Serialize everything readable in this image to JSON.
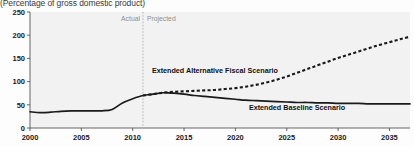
{
  "subtitle": "(Percentage of gross domestic product)",
  "annotations": {
    "actual": "Actual",
    "projected": "Projected",
    "divider_year": 2011
  },
  "colors": {
    "line": "#1a1a1a",
    "divider": "#b0b0b0",
    "axis": "#555555",
    "plot_background": "#f2f2f2",
    "annotation_text": "#8e8e8e"
  },
  "chart_data": {
    "type": "line",
    "title": "",
    "subtitle": "(Percentage of gross domestic product)",
    "xlabel": "",
    "ylabel": "",
    "xlim": [
      2000,
      2037
    ],
    "ylim": [
      0,
      250
    ],
    "yticks": [
      0,
      50,
      100,
      150,
      200,
      250
    ],
    "xticks": [
      2000,
      2005,
      2010,
      2015,
      2020,
      2025,
      2030,
      2035
    ],
    "grid": false,
    "legend_position": "inline-annotations",
    "series": [
      {
        "name": "Extended Alternative Fiscal Scenario",
        "style": "dashed",
        "label_x": 2018,
        "label_y": 118,
        "x": [
          2011,
          2012,
          2013,
          2014,
          2015,
          2016,
          2017,
          2018,
          2019,
          2020,
          2021,
          2022,
          2023,
          2024,
          2025,
          2026,
          2027,
          2028,
          2029,
          2030,
          2031,
          2032,
          2033,
          2034,
          2035,
          2036,
          2037
        ],
        "values": [
          70,
          73,
          76,
          78,
          79,
          80,
          81,
          82,
          84,
          86,
          89,
          93,
          98,
          104,
          111,
          119,
          127,
          135,
          143,
          151,
          158,
          165,
          172,
          179,
          185,
          191,
          197
        ]
      },
      {
        "name": "Extended Baseline Scenario",
        "style": "solid",
        "label_x": 2026,
        "label_y": 38,
        "x": [
          2000,
          2001,
          2002,
          2003,
          2004,
          2005,
          2006,
          2007,
          2008,
          2009,
          2010,
          2011,
          2012,
          2013,
          2014,
          2015,
          2016,
          2017,
          2018,
          2019,
          2020,
          2021,
          2022,
          2023,
          2024,
          2025,
          2026,
          2027,
          2028,
          2029,
          2030,
          2031,
          2032,
          2033,
          2034,
          2035,
          2036,
          2037
        ],
        "values": [
          35,
          33,
          34,
          36,
          37,
          37,
          37,
          37,
          40,
          54,
          63,
          70,
          73,
          76,
          75,
          73,
          70,
          68,
          66,
          64,
          62,
          60,
          59,
          58,
          57,
          56,
          55,
          55,
          54,
          54,
          53,
          53,
          53,
          52,
          52,
          52,
          52,
          52
        ]
      }
    ]
  }
}
